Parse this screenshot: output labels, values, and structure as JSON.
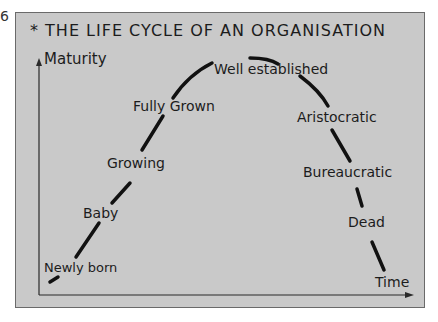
{
  "page_number": "6",
  "title": "* THE LIFE CYCLE OF AN ORGANISATION",
  "axes": {
    "y_label": "Maturity",
    "x_label": "Time"
  },
  "stages": [
    {
      "label": "Newly born",
      "x": 44,
      "y": 272
    },
    {
      "label": "Baby",
      "x": 83,
      "y": 218
    },
    {
      "label": "Growing",
      "x": 107,
      "y": 168
    },
    {
      "label": "Fully Grown",
      "x": 133,
      "y": 111
    },
    {
      "label": "Well established",
      "x": 214,
      "y": 74
    },
    {
      "label": "Aristocratic",
      "x": 297,
      "y": 122
    },
    {
      "label": "Bureaucratic",
      "x": 303,
      "y": 177
    },
    {
      "label": "Dead",
      "x": 348,
      "y": 227
    }
  ],
  "colors": {
    "card": "#c9c9c9",
    "ink": "#1c1c1c",
    "border": "#6a6a6a"
  }
}
